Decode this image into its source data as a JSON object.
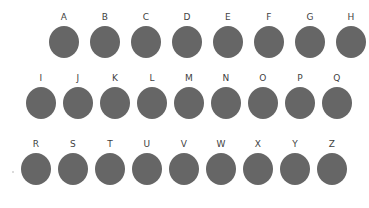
{
  "figure": {
    "background_color": "#ffffff",
    "dot_color": "#666666",
    "label_color": "#3f3f3f",
    "rows": [
      {
        "id": "row-1",
        "labels": [
          "A",
          "B",
          "C",
          "D",
          "E",
          "F",
          "G",
          "H"
        ]
      },
      {
        "id": "row-2",
        "labels": [
          "I",
          "J",
          "K",
          "L",
          "M",
          "N",
          "O",
          "P",
          "Q"
        ]
      },
      {
        "id": "row-3",
        "labels": [
          "R",
          "S",
          "T",
          "U",
          "V",
          "W",
          "X",
          "Y",
          "Z"
        ]
      }
    ]
  }
}
